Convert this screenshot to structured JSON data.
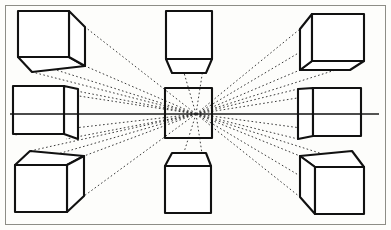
{
  "figure": {
    "type": "line-diagram",
    "width": 391,
    "height": 230,
    "background_color": "#fdfdfb",
    "ink_color": "#111111",
    "frame_color": "#8d8d86",
    "vanishing_point": {
      "x": 196,
      "y": 114,
      "label": "center vanishing point"
    },
    "horizon_line": {
      "y": 114,
      "x_start": 10,
      "x_end": 379,
      "color": "#1b1b1b"
    },
    "stroke_widths": {
      "cube_edge": 2.1,
      "cube_edge_thin": 1.5,
      "ray": 1.0,
      "frame": 1.0
    },
    "ray_style": {
      "dash": "1.6 2.4",
      "color": "#3a3a3a",
      "count": 24
    }
  },
  "cubes": [
    {
      "id": "cube-top-left",
      "position": "top-left",
      "description": "Cube above and left of the vanishing point; front face square, right side face and bottom face visible, receding toward center.",
      "front_face": {
        "x": 18,
        "y": 11,
        "w": 51,
        "h": 46
      },
      "recede_to": "down-right"
    },
    {
      "id": "cube-middle-left",
      "position": "middle-left",
      "description": "Cube on the horizon line at left; seen nearly edge-on, right side face is a narrow tapering sliver, horizon line cuts across it.",
      "front_face": {
        "x": 13,
        "y": 86,
        "w": 51,
        "h": 48
      },
      "recede_to": "right"
    },
    {
      "id": "cube-bottom-left",
      "position": "bottom-left",
      "description": "Cube below and left of the vanishing point; front face square, top face and right side face visible, receding up toward center.",
      "front_face": {
        "x": 15,
        "y": 165,
        "w": 52,
        "h": 47
      },
      "recede_to": "up-right"
    },
    {
      "id": "cube-top-center",
      "position": "top-center",
      "description": "Cube directly above the vanishing point; only the front face and the tapering bottom face are visible, no side faces.",
      "front_face": {
        "x": 166,
        "y": 11,
        "w": 46,
        "h": 48
      },
      "recede_to": "down"
    },
    {
      "id": "cube-center",
      "position": "center",
      "description": "Cube centered on the vanishing point; appears as a plain square because all receding edges point straight away from the viewer.",
      "front_face": {
        "x": 165,
        "y": 88,
        "w": 47,
        "h": 50
      },
      "recede_to": "none"
    },
    {
      "id": "cube-bottom-center",
      "position": "bottom-center",
      "description": "Cube directly below the vanishing point; only the front face and the tapering top face are visible.",
      "front_face": {
        "x": 165,
        "y": 166,
        "w": 46,
        "h": 47
      },
      "recede_to": "up"
    },
    {
      "id": "cube-top-right",
      "position": "top-right",
      "description": "Cube above and right of the vanishing point; front face square, left side face and bottom face visible, receding toward center.",
      "front_face": {
        "x": 312,
        "y": 14,
        "w": 52,
        "h": 47
      },
      "recede_to": "down-left"
    },
    {
      "id": "cube-middle-right",
      "position": "middle-right",
      "description": "Cube on the horizon line at right; seen nearly edge-on, left side face is a narrow tapering sliver, horizon line passes through and beyond it.",
      "front_face": {
        "x": 313,
        "y": 88,
        "w": 48,
        "h": 48
      },
      "recede_to": "left"
    },
    {
      "id": "cube-bottom-right",
      "position": "bottom-right",
      "description": "Cube below and right of the vanishing point; front face square, top face and left side face visible, receding up toward center.",
      "front_face": {
        "x": 315,
        "y": 167,
        "w": 49,
        "h": 47
      },
      "recede_to": "up-left"
    }
  ]
}
